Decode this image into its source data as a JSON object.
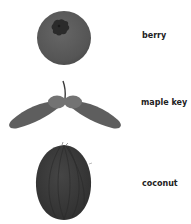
{
  "items": [
    {
      "label": "berry",
      "icon": "berry-icon"
    },
    {
      "label": "maple key",
      "icon": "maple-key-icon"
    },
    {
      "label": "coconut",
      "icon": "coconut-icon"
    }
  ],
  "colors": {
    "berry_fill": "#5a5a5a",
    "berry_crown": "#2b2b2b",
    "maple_wing": "#5e5e5e",
    "maple_seed": "#737373",
    "maple_stem": "#3a3a3a",
    "coconut_fill": "#3c3c3c",
    "label_text": "#222222"
  }
}
